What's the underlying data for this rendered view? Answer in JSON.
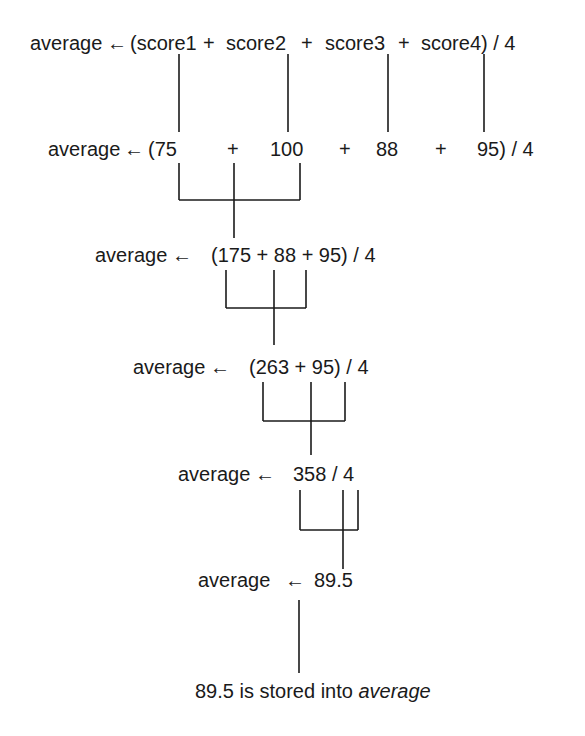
{
  "diagram": {
    "steps": [
      {
        "label": "average",
        "arrow": "←",
        "expr_parts": [
          "(score1",
          "+",
          "score2",
          "+",
          "score3",
          "+",
          "score4) / 4"
        ]
      },
      {
        "label": "average",
        "arrow": "←",
        "expr_parts": [
          "(75",
          "+",
          "100",
          "+",
          "88",
          "+",
          "95) / 4"
        ]
      },
      {
        "label": "average",
        "arrow": "←",
        "expr": "(175 + 88 + 95) / 4"
      },
      {
        "label": "average",
        "arrow": "←",
        "expr": "(263 + 95) / 4"
      },
      {
        "label": "average",
        "arrow": "←",
        "expr": "358 / 4"
      },
      {
        "label": "average",
        "arrow": "←",
        "expr": "89.5"
      }
    ],
    "result": {
      "prefix": "89.5 is stored into ",
      "variable": "average"
    }
  }
}
